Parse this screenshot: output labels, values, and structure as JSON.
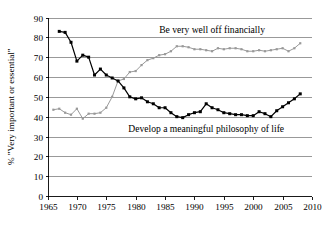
{
  "chart_data": {
    "type": "line",
    "title": "",
    "xlabel": "",
    "ylabel": "% \"Very important or essential\"",
    "xlim": [
      1965,
      2010
    ],
    "ylim": [
      0,
      90
    ],
    "grid": "horizontal",
    "legend_position": "inline-annotations",
    "xticks": [
      1965,
      1970,
      1975,
      1980,
      1985,
      1990,
      1995,
      2000,
      2005,
      2010
    ],
    "yticks": [
      0,
      10,
      20,
      30,
      40,
      50,
      60,
      70,
      80,
      90
    ],
    "annotations": [
      {
        "text": "Be very well off financially",
        "series": "financially",
        "x": 1993,
        "y": 84
      },
      {
        "text": "Develop a meaningful philosophy of life",
        "series": "philosophy",
        "x": 1992,
        "y": 34
      }
    ],
    "series": [
      {
        "name": "Be very well off financially",
        "color": "#999999",
        "marker": "square",
        "x": [
          1966,
          1967,
          1968,
          1969,
          1970,
          1971,
          1972,
          1973,
          1974,
          1975,
          1976,
          1977,
          1978,
          1979,
          1980,
          1981,
          1982,
          1983,
          1984,
          1985,
          1986,
          1987,
          1988,
          1989,
          1990,
          1991,
          1992,
          1993,
          1994,
          1995,
          1996,
          1997,
          1998,
          1999,
          2000,
          2001,
          2002,
          2003,
          2004,
          2005,
          2006,
          2007,
          2008
        ],
        "values": [
          43.5,
          44.0,
          42.0,
          41.0,
          44.0,
          39.0,
          41.5,
          41.5,
          42.0,
          44.5,
          50.0,
          58.0,
          59.0,
          62.5,
          63.0,
          66.0,
          68.5,
          69.5,
          71.0,
          71.5,
          73.0,
          75.5,
          75.5,
          75.0,
          74.0,
          74.0,
          73.5,
          73.0,
          74.5,
          74.0,
          74.5,
          74.5,
          74.0,
          73.0,
          73.0,
          73.5,
          73.0,
          73.5,
          74.0,
          74.5,
          73.0,
          74.5,
          77.0
        ],
        "units": "percent"
      },
      {
        "name": "Develop a meaningful philosophy of life",
        "color": "#000000",
        "marker": "square",
        "x": [
          1967,
          1968,
          1969,
          1970,
          1971,
          1972,
          1973,
          1974,
          1975,
          1976,
          1977,
          1978,
          1979,
          1980,
          1981,
          1982,
          1983,
          1984,
          1985,
          1986,
          1987,
          1988,
          1989,
          1990,
          1991,
          1992,
          1993,
          1994,
          1995,
          1996,
          1997,
          1998,
          1999,
          2000,
          2001,
          2002,
          2003,
          2004,
          2005,
          2006,
          2007,
          2008
        ],
        "values": [
          83.0,
          82.5,
          77.5,
          68.0,
          71.0,
          70.0,
          61.0,
          64.0,
          61.0,
          59.5,
          58.0,
          54.5,
          50.0,
          49.0,
          49.5,
          47.5,
          46.5,
          44.5,
          44.5,
          42.0,
          40.0,
          39.5,
          41.0,
          42.0,
          42.5,
          46.5,
          44.5,
          43.5,
          42.0,
          41.5,
          41.0,
          41.0,
          40.5,
          40.5,
          42.5,
          41.5,
          40.0,
          43.0,
          45.0,
          47.0,
          49.0,
          51.5
        ],
        "units": "percent"
      }
    ]
  }
}
